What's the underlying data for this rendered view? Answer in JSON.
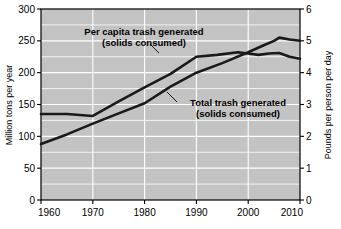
{
  "chart_data": {
    "type": "line",
    "title": "",
    "xlabel": "",
    "ylabel": "Million tons per year",
    "y2label": "Pounds per person per day",
    "xlim": [
      1960,
      2010
    ],
    "ylim": [
      0,
      300
    ],
    "y2lim": [
      0,
      6
    ],
    "xticks": [
      "1960",
      "1970",
      "1980",
      "1990",
      "2000",
      "2010"
    ],
    "xtick_values": [
      1960,
      1970,
      1980,
      1990,
      2000,
      2010
    ],
    "yticks": [
      "0",
      "50",
      "100",
      "150",
      "200",
      "250",
      "300"
    ],
    "ytick_values": [
      0,
      50,
      100,
      150,
      200,
      250,
      300
    ],
    "y2ticks": [
      "0",
      "1",
      "2",
      "3",
      "4",
      "5",
      "6"
    ],
    "y2tick_values": [
      0,
      1,
      2,
      3,
      4,
      5,
      6
    ],
    "grid": true,
    "grid_color": "#ffffff",
    "plot_bg": "#c3c3c3",
    "line_color": "#1a1a1a",
    "legend": "annotations-inline",
    "series": [
      {
        "name": "Per capita trash generated (solids consumed)",
        "axis": "right",
        "x": [
          1960,
          1965,
          1970,
          1975,
          1980,
          1985,
          1990,
          1994,
          1998,
          2000,
          2002,
          2004,
          2006,
          2008,
          2010
        ],
        "values_right_axis": [
          2.7,
          2.7,
          2.65,
          3.1,
          3.55,
          3.95,
          4.5,
          4.55,
          4.65,
          4.6,
          4.55,
          4.6,
          4.62,
          4.5,
          4.45
        ],
        "values_left_axis_equivalent": [
          135,
          135,
          132,
          155,
          177,
          198,
          225,
          228,
          232,
          230,
          228,
          230,
          231,
          225,
          222
        ]
      },
      {
        "name": "Total trash generated (solids consumed)",
        "axis": "left",
        "x": [
          1960,
          1965,
          1970,
          1975,
          1980,
          1985,
          1990,
          1995,
          2000,
          2003,
          2005,
          2006,
          2008,
          2010
        ],
        "values": [
          88,
          103,
          120,
          136,
          152,
          178,
          200,
          215,
          232,
          243,
          250,
          255,
          252,
          250
        ]
      }
    ],
    "annotations": [
      {
        "name": "per-capita-annotation",
        "line1": "Per capita trash generated",
        "line2": "(solids consumed)"
      },
      {
        "name": "total-trash-annotation",
        "line1": "Total trash generated",
        "line2": "(solids consumed)"
      }
    ]
  }
}
